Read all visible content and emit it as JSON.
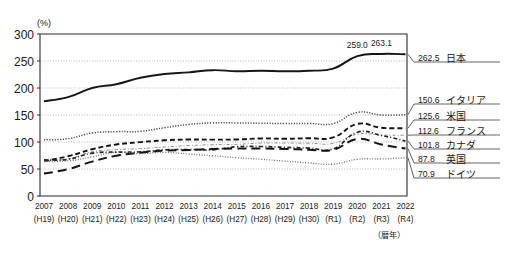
{
  "axis": {
    "unit_label": "(%)",
    "y_ticks": [
      0,
      50,
      100,
      150,
      200,
      250,
      300
    ],
    "y_min": 0,
    "y_max": 300,
    "x_note": "（暦年）"
  },
  "x_labels": [
    {
      "year": "2007",
      "era": "(H19)"
    },
    {
      "year": "2008",
      "era": "(H20)"
    },
    {
      "year": "2009",
      "era": "(H21)"
    },
    {
      "year": "2010",
      "era": "(H22)"
    },
    {
      "year": "2011",
      "era": "(H23)"
    },
    {
      "year": "2012",
      "era": "(H24)"
    },
    {
      "year": "2013",
      "era": "(H25)"
    },
    {
      "year": "2014",
      "era": "(H26)"
    },
    {
      "year": "2015",
      "era": "(H27)"
    },
    {
      "year": "2016",
      "era": "(H28)"
    },
    {
      "year": "2017",
      "era": "(H29)"
    },
    {
      "year": "2018",
      "era": "(H30)"
    },
    {
      "year": "2019",
      "era": "(R1)"
    },
    {
      "year": "2020",
      "era": "(R2)"
    },
    {
      "year": "2021",
      "era": "(R3)"
    },
    {
      "year": "2022",
      "era": "(R4)"
    }
  ],
  "peak_annotations": [
    {
      "text": "259.0",
      "x": 2020,
      "y": 259.0
    },
    {
      "text": "263.1",
      "x": 2021,
      "y": 263.1
    }
  ],
  "end_labels": [
    {
      "value": "262.5",
      "name": "日本",
      "y": 262.5
    },
    {
      "value": "150.6",
      "name": "イタリア",
      "y": 150.6
    },
    {
      "value": "125.6",
      "name": "米国",
      "y": 125.6
    },
    {
      "value": "112.6",
      "name": "フランス",
      "y": 112.6
    },
    {
      "value": "101.8",
      "name": "カナダ",
      "y": 101.8
    },
    {
      "value": "87.8",
      "name": "英国",
      "y": 87.8
    },
    {
      "value": "70.9",
      "name": "ドイツ",
      "y": 70.9
    }
  ],
  "chart_data": {
    "type": "line",
    "title": "",
    "xlabel": "（暦年）",
    "ylabel": "(%)",
    "ylim": [
      0,
      300
    ],
    "grid": true,
    "legend": "right-end-labels",
    "x": [
      "2007",
      "2008",
      "2009",
      "2010",
      "2011",
      "2012",
      "2013",
      "2014",
      "2015",
      "2016",
      "2017",
      "2018",
      "2019",
      "2020",
      "2021",
      "2022"
    ],
    "series": [
      {
        "name": "日本",
        "style": "solid",
        "color": "#1a1a1a",
        "values": [
          175.5,
          183.0,
          200.0,
          207.0,
          219.0,
          226.0,
          229.0,
          233.0,
          231.0,
          232.0,
          231.0,
          232.0,
          236.0,
          259.0,
          263.1,
          262.5
        ]
      },
      {
        "name": "イタリア",
        "style": "fine-dot",
        "color": "#555555",
        "values": [
          103.9,
          106.2,
          116.6,
          119.2,
          119.7,
          126.5,
          132.5,
          135.4,
          135.3,
          134.8,
          134.2,
          134.4,
          134.1,
          154.9,
          149.9,
          150.6
        ]
      },
      {
        "name": "米国",
        "style": "dash",
        "color": "#1a1a1a",
        "values": [
          64.6,
          73.6,
          86.6,
          95.4,
          99.7,
          103.2,
          104.6,
          104.4,
          104.7,
          106.6,
          106.0,
          107.0,
          108.4,
          133.5,
          126.4,
          125.6
        ]
      },
      {
        "name": "フランス",
        "style": "thin-dashdot",
        "color": "#7a7a7a",
        "values": [
          64.5,
          68.8,
          81.7,
          85.8,
          87.8,
          90.6,
          93.4,
          94.9,
          95.6,
          98.0,
          98.1,
          97.8,
          97.4,
          114.6,
          112.8,
          112.6
        ]
      },
      {
        "name": "カナダ",
        "style": "dot-dash",
        "color": "#2a2a2a",
        "values": [
          66.8,
          67.8,
          79.3,
          81.2,
          81.8,
          85.5,
          86.1,
          85.6,
          91.2,
          91.7,
          90.1,
          88.8,
          87.2,
          118.1,
          112.1,
          101.8
        ]
      },
      {
        "name": "英国",
        "style": "long-dash",
        "color": "#1a1a1a",
        "values": [
          41.7,
          49.7,
          63.7,
          74.6,
          80.1,
          84.1,
          85.2,
          87.0,
          87.9,
          87.9,
          87.1,
          85.8,
          85.5,
          105.6,
          95.3,
          87.8
        ]
      },
      {
        "name": "ドイツ",
        "style": "fine-dot2",
        "color": "#6a6a6a",
        "values": [
          63.7,
          65.0,
          72.4,
          81.0,
          78.4,
          80.9,
          77.7,
          74.5,
          70.9,
          68.1,
          64.6,
          61.3,
          58.9,
          68.0,
          68.6,
          70.9
        ]
      }
    ]
  }
}
